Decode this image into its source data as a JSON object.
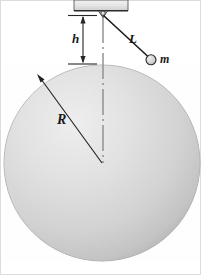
{
  "figure": {
    "background_color": "#ffffff",
    "border_color": "#d8d8d8",
    "width": 201,
    "height": 275
  },
  "labels": {
    "height_gap": "h",
    "string_length": "L",
    "bob_mass": "m",
    "sphere_radius": "R"
  },
  "colors": {
    "sphere_fill_light": "#e9e9e9",
    "sphere_fill_mid": "#d2d2d2",
    "sphere_fill_dark": "#b9b9b9",
    "sphere_outline": "#9a9a9a",
    "line_dark": "#1a1a1a",
    "centerline": "#8c8c8c",
    "ceiling_fill": "#e3e3e3",
    "ceiling_edge": "#4a4a4a",
    "bob_fill": "#cfcfcf"
  },
  "geometry": {
    "sphere": {
      "cx": 102,
      "cy": 163,
      "r": 98
    },
    "pivot": {
      "x": 103,
      "y": 15
    },
    "bob": {
      "cx": 151,
      "cy": 60,
      "r": 5
    },
    "ceiling_block": {
      "x": 74,
      "y": 0,
      "width": 54,
      "height": 11
    },
    "dimension_h": {
      "x": 83,
      "y_top": 15,
      "y_bottom": 64
    },
    "radius_arrow": {
      "x1": 102,
      "y1": 163,
      "x2": 38,
      "y2": 76
    },
    "centerline": {
      "x": 103,
      "y_top": 17,
      "y_bottom": 163
    }
  },
  "elements": {
    "sphere_name": "large-sphere",
    "ceiling_name": "ceiling-support-block",
    "pivot_name": "pivot-hook",
    "string_name": "pendulum-string",
    "bob_name": "pendulum-bob",
    "dimension_name": "height-dimension-h",
    "radius_name": "radius-arrow-R",
    "centerline_name": "vertical-centerline"
  }
}
